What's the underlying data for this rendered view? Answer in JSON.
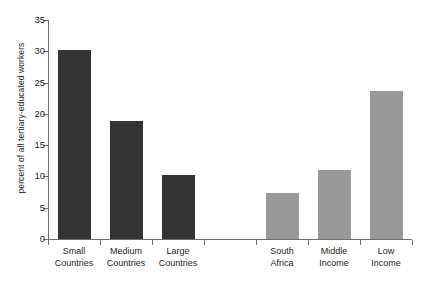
{
  "chart_data": {
    "type": "bar",
    "title": "",
    "subtitle": "",
    "xlabel": "",
    "ylabel": "percent of all tertiary-educated workers",
    "ylim": [
      0,
      35
    ],
    "yticks": [
      0,
      5,
      10,
      15,
      20,
      25,
      30,
      35
    ],
    "grid": false,
    "legend": false,
    "categories": [
      "Small Countries",
      "Medium Countries",
      "Large Countries",
      "",
      "South Africa",
      "Middle Income",
      "Low Income"
    ],
    "category_lines": [
      [
        "Small",
        "Countries"
      ],
      [
        "Medium",
        "Countries"
      ],
      [
        "Large",
        "Countries"
      ],
      [
        "",
        ""
      ],
      [
        "South",
        "Africa"
      ],
      [
        "Middle",
        "Income"
      ],
      [
        "Low",
        "Income"
      ]
    ],
    "values": [
      30.2,
      18.9,
      10.3,
      null,
      7.3,
      11.1,
      23.7
    ],
    "bar_colors": [
      "#333333",
      "#333333",
      "#333333",
      null,
      "#999999",
      "#999999",
      "#999999"
    ],
    "colors": {
      "dark_bar": "#333333",
      "light_bar": "#999999",
      "axis": "#6d6e71",
      "text": "#231f20",
      "background": "#ffffff"
    }
  }
}
